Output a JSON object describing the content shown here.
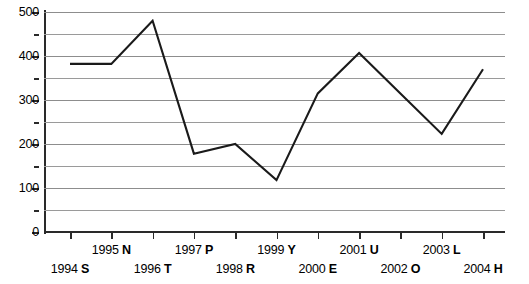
{
  "chart_data": {
    "type": "line",
    "title": "",
    "xlabel": "",
    "ylabel": "",
    "ylim": [
      0,
      500
    ],
    "grid": true,
    "legend": false,
    "y_ticks_major": [
      0,
      100,
      200,
      300,
      400,
      500
    ],
    "y_ticks_minor": [
      50,
      150,
      250,
      350,
      450
    ],
    "y_tick_labels": [
      "0",
      "100",
      "200",
      "300",
      "400",
      "500"
    ],
    "categories": [
      "1994 S",
      "1995 N",
      "1996 T",
      "1997 P",
      "1998 R",
      "1999 Y",
      "2000 E",
      "2001 U",
      "2002 O",
      "2003 L",
      "2004 H"
    ],
    "category_years": [
      "1994",
      "1995",
      "1996",
      "1997",
      "1998",
      "1999",
      "2000",
      "2001",
      "2002",
      "2003",
      "2004"
    ],
    "category_codes": [
      "S",
      "N",
      "T",
      "P",
      "R",
      "Y",
      "E",
      "U",
      "O",
      "L",
      "H"
    ],
    "values": [
      382,
      382,
      480,
      178,
      200,
      118,
      315,
      407,
      315,
      223,
      370
    ],
    "line_color": "#1a1a1a",
    "grid_color": "#9a9a9a",
    "axis_color": "#2a2a2a",
    "background_color": "#ffffff"
  }
}
